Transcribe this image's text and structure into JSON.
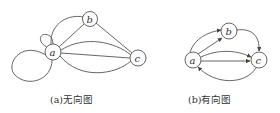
{
  "figures": [
    {
      "id": "undirected",
      "caption": "(a)无向图",
      "nodes": [
        {
          "label": "a"
        },
        {
          "label": "b"
        },
        {
          "label": "c"
        }
      ],
      "edges": [
        "a-a (small loop)",
        "a-a (large loop)",
        "a-b",
        "a-b (curved)",
        "a-c",
        "a-c (curved up)",
        "a-c (curved down)",
        "b-c"
      ]
    },
    {
      "id": "directed",
      "caption": "(b)有向图",
      "nodes": [
        {
          "label": "a"
        },
        {
          "label": "b"
        },
        {
          "label": "c"
        }
      ],
      "edges": [
        "a→b",
        "a→b (curved)",
        "a→c",
        "a→c (curved up)",
        "c→a (curved down)",
        "b→c"
      ]
    }
  ],
  "colors": {
    "stroke": "#555555",
    "text": "#333333",
    "background": "#ffffff"
  }
}
